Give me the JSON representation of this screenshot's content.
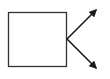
{
  "diagram": {
    "stroke_color": "#1a1a1a",
    "background": "#ffffff",
    "box": {
      "x": 8,
      "y": 12,
      "width": 59,
      "height": 55,
      "label": ""
    },
    "arrows": [
      {
        "name": "upper-right",
        "from": [
          67,
          39
        ],
        "to": [
          97,
          9
        ]
      },
      {
        "name": "lower-right",
        "from": [
          67,
          39
        ],
        "to": [
          97,
          69
        ]
      }
    ]
  }
}
